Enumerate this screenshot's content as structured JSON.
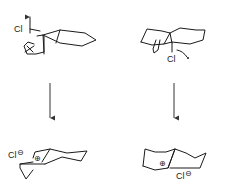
{
  "diagram": {
    "type": "reaction-scheme",
    "colors": {
      "ink": "#1a1a1a",
      "arrow": "#333333",
      "background": "#ffffff"
    },
    "reactions": [
      {
        "id": "left",
        "reactant": {
          "leaving_group_label": "Cl",
          "arrow_icon": "curved-electron-arrow"
        },
        "arrow": "down-arrow",
        "product": {
          "counterion_label": "Cl",
          "counterion_charge": "⊖",
          "cation_charge": "⊕"
        }
      },
      {
        "id": "right",
        "reactant": {
          "leaving_group_label": "Cl",
          "arrow_icon": "curved-electron-arrow"
        },
        "arrow": "down-arrow",
        "product": {
          "counterion_label": "Cl",
          "counterion_charge": "⊖",
          "cation_charge": "⊕"
        }
      }
    ]
  }
}
